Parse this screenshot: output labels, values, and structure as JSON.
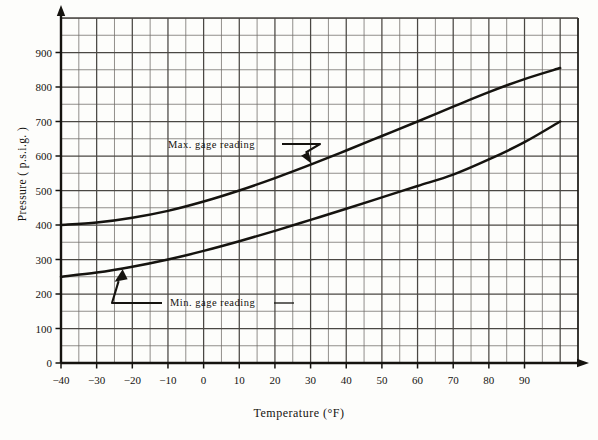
{
  "chart_data": {
    "type": "line",
    "title": "",
    "xlabel": "Temperature  (°F)",
    "ylabel": "Pressure  ( p.s.i.g. )",
    "xlim": [
      -40,
      105
    ],
    "ylim": [
      0,
      1000
    ],
    "x_major_step": 10,
    "x_minor_step": 5,
    "y_major_step": 100,
    "y_minor_step": 50,
    "grid": true,
    "legend_position": "inline-annotations",
    "xtick_labels": [
      "-40",
      "-30",
      "-20",
      "-10",
      "0",
      "10",
      "20",
      "30",
      "40",
      "50",
      "60",
      "70",
      "80",
      "90"
    ],
    "xtick_values": [
      -40,
      -30,
      -20,
      -10,
      0,
      10,
      20,
      30,
      40,
      50,
      60,
      70,
      80,
      90
    ],
    "ytick_labels": [
      "0",
      "100",
      "200",
      "300",
      "400",
      "500",
      "600",
      "700",
      "800",
      "900"
    ],
    "ytick_values": [
      0,
      100,
      200,
      300,
      400,
      500,
      600,
      700,
      800,
      900
    ],
    "series": [
      {
        "name": "Max. gage reading",
        "x": [
          -40,
          -30,
          -20,
          -10,
          0,
          10,
          20,
          30,
          40,
          50,
          60,
          70,
          80,
          90,
          100
        ],
        "values": [
          400,
          407,
          421,
          441,
          468,
          500,
          536,
          575,
          616,
          658,
          700,
          743,
          785,
          823,
          855
        ]
      },
      {
        "name": "Min. gage reading",
        "x": [
          -40,
          -30,
          -20,
          -10,
          0,
          10,
          20,
          30,
          40,
          50,
          60,
          70,
          80,
          90,
          100
        ],
        "values": [
          250,
          262,
          279,
          300,
          325,
          353,
          383,
          415,
          447,
          480,
          513,
          546,
          590,
          640,
          700
        ]
      }
    ],
    "annotations": [
      {
        "text": "Max. gage reading",
        "points_to_x": 30,
        "points_to_y": 575
      },
      {
        "text": "Min. gage reading",
        "points_to_x": -23,
        "points_to_y": 275
      }
    ]
  },
  "axes": {
    "y_axis_title": "Pressure  ( p.s.i.g. )",
    "x_axis_title": "Temperature  (°F)"
  },
  "colors": {
    "ink": "#15130f",
    "grid": "#4a4743",
    "paper": "#fdfdfb"
  },
  "page_bleed_text": ""
}
